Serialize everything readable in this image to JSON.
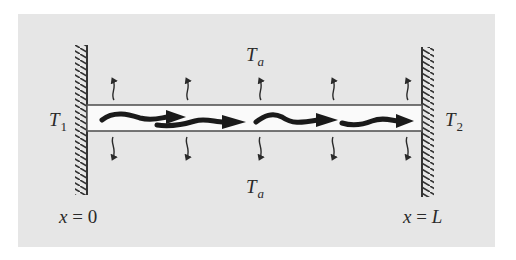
{
  "figure": {
    "background_color": "#e6e6e6",
    "rod_fill": "#fafafa",
    "ink_color": "#2a2a2a",
    "labels": {
      "left_temp": {
        "base": "T",
        "sub": "1"
      },
      "right_temp": {
        "base": "T",
        "sub": "2"
      },
      "ambient_top": {
        "base": "T",
        "sub": "a"
      },
      "ambient_bottom": {
        "base": "T",
        "sub": "a"
      },
      "left_position": {
        "var": "x",
        "eq": " = ",
        "val": "0"
      },
      "right_position": {
        "var": "x",
        "eq": " = ",
        "val": "L"
      }
    },
    "heat_loss_arrow_x": [
      113,
      187,
      260,
      333,
      407
    ],
    "conduction_arrows": 4,
    "walls": [
      "left",
      "right"
    ]
  }
}
